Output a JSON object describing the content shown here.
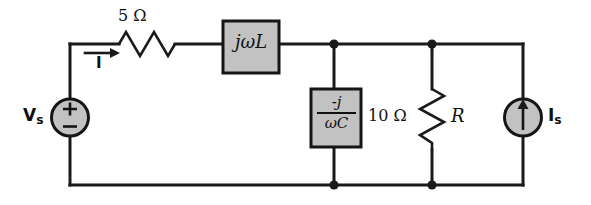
{
  "figure": {
    "background_color": "#ffffff",
    "wire_color": "#1a1a1a",
    "component_fill_color": "#c2c2c2"
  },
  "labels": {
    "resistor_series_value": "5 Ω",
    "current_label": "I",
    "current_subscript": "",
    "inductor_impedance": "jωL",
    "capacitor_numerator": "-j",
    "capacitor_denominator": "ωC",
    "resistor_shunt_value": "10 Ω",
    "resistor_shunt_name": "R",
    "voltage_source_name": "V",
    "voltage_source_subscript": "s",
    "voltage_plus": "+",
    "voltage_minus": "−",
    "current_source_name": "I",
    "current_source_subscript": "s"
  },
  "components": [
    {
      "id": "voltage-source",
      "type": "independent-voltage-source",
      "label": "Vs",
      "shape": "circle",
      "polarity": "+ on top, − on bottom"
    },
    {
      "id": "series-resistor",
      "type": "resistor",
      "label": "5 Ω",
      "shape": "zigzag",
      "orientation": "horizontal"
    },
    {
      "id": "inductor-box",
      "type": "impedance-box",
      "label": "jωL",
      "shape": "rectangle"
    },
    {
      "id": "capacitor-box",
      "type": "impedance-box",
      "label": "-j/ωC",
      "shape": "rectangle"
    },
    {
      "id": "shunt-resistor",
      "type": "resistor",
      "label": "10 Ω",
      "name": "R",
      "shape": "zigzag",
      "orientation": "vertical"
    },
    {
      "id": "current-source",
      "type": "independent-current-source",
      "label": "Is",
      "shape": "circle",
      "arrow_direction": "up"
    }
  ],
  "nodes": [
    {
      "id": "node-top-middle",
      "x": 334,
      "y": 44
    },
    {
      "id": "node-top-right",
      "x": 432,
      "y": 44
    },
    {
      "id": "node-bottom-middle",
      "x": 334,
      "y": 185
    },
    {
      "id": "node-bottom-right",
      "x": 432,
      "y": 185
    }
  ]
}
